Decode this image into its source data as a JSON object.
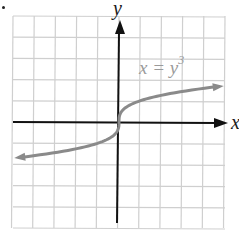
{
  "chart_data": {
    "type": "line",
    "title": "",
    "xlabel": "x",
    "ylabel": "y",
    "equation_label": "x = y³",
    "equation": "x = y^3",
    "grid": true,
    "grid_spacing_units": 1,
    "xlim": [
      -5,
      5
    ],
    "ylim": [
      -5,
      5
    ],
    "series": [
      {
        "name": "x = y³",
        "color": "#8a8a8a",
        "points": [
          {
            "x": -5,
            "y": -1.71
          },
          {
            "x": -3.375,
            "y": -1.5
          },
          {
            "x": -1,
            "y": -1
          },
          {
            "x": -0.125,
            "y": -0.5
          },
          {
            "x": 0,
            "y": 0
          },
          {
            "x": 0.125,
            "y": 0.5
          },
          {
            "x": 1,
            "y": 1
          },
          {
            "x": 3.375,
            "y": 1.5
          },
          {
            "x": 5,
            "y": 1.71
          }
        ],
        "arrows_both_ends": true
      }
    ]
  },
  "labels": {
    "x_axis": "x",
    "y_axis": "y",
    "eq_lhs": "x = y",
    "eq_exp": "3"
  },
  "colors": {
    "grid": "#c8c8c8",
    "axis": "#111111",
    "curve": "#8a8a8a"
  }
}
